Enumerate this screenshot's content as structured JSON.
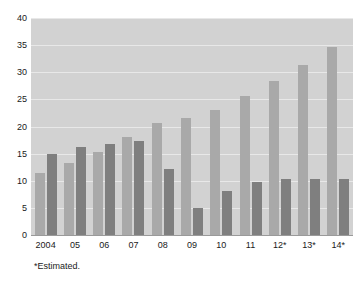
{
  "chart_data": {
    "type": "bar",
    "title": "",
    "subtitle": "",
    "xlabel": "",
    "ylabel": "",
    "ylim": [
      0,
      40
    ],
    "yticks": [
      0,
      5,
      10,
      15,
      20,
      25,
      30,
      35,
      40
    ],
    "ytick_labels": [
      "0",
      "5",
      "10",
      "15",
      "20",
      "25",
      "30",
      "35",
      "40"
    ],
    "grid": true,
    "legend": null,
    "legend_position": "none",
    "categories": [
      "2004",
      "05",
      "06",
      "07",
      "08",
      "09",
      "10",
      "11",
      "12*",
      "13*",
      "14*"
    ],
    "series": [
      {
        "name": "series-a",
        "color": "#a9a9a9",
        "values": [
          11.4,
          13.3,
          15.3,
          18.1,
          20.6,
          21.5,
          23.1,
          25.7,
          28.3,
          31.4,
          34.6
        ]
      },
      {
        "name": "series-b",
        "color": "#7f7f7f",
        "values": [
          15.0,
          16.3,
          16.7,
          17.3,
          12.2,
          5.0,
          8.2,
          9.7,
          10.4,
          10.4,
          10.4
        ]
      }
    ],
    "annotations": [
      "*Estimated."
    ],
    "footnote": "*Estimated.",
    "plot_background": "#d2d2d2",
    "page_background": "#ffffff",
    "gridline_color": "#e8e8e8"
  }
}
